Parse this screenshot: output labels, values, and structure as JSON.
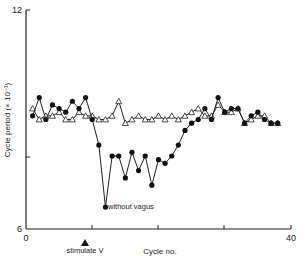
{
  "chart_data": {
    "type": "line",
    "title": "",
    "xlabel": "Cycle no.",
    "ylabel": "Cycle period (× 10⁻¹)",
    "xlim": [
      0,
      40
    ],
    "ylim": [
      6,
      12
    ],
    "x_ticks": [
      "0",
      "40"
    ],
    "y_ticks": [
      "6",
      "12"
    ],
    "grid": false,
    "annotations": [
      {
        "text": "stimulate V",
        "x": 12,
        "marker": "triangle-up",
        "position": "below x-axis"
      },
      {
        "text": "without vagus",
        "x": 21,
        "y": 7.1
      }
    ],
    "series": [
      {
        "name": "without vagus",
        "marker": "filled-circle",
        "x": [
          0,
          1,
          2,
          3,
          4,
          5,
          6,
          7,
          8,
          9,
          10,
          11,
          12,
          13,
          14,
          15,
          16,
          17,
          18,
          19,
          20,
          21,
          22,
          23,
          24,
          25,
          26,
          27,
          28,
          29,
          30,
          31,
          32,
          33,
          34,
          35,
          36,
          37
        ],
        "y": [
          9.1,
          9.6,
          9.0,
          9.4,
          9.3,
          9.2,
          9.5,
          9.3,
          9.6,
          9.0,
          8.3,
          6.6,
          8.0,
          8.0,
          7.4,
          8.1,
          7.6,
          8.0,
          7.2,
          7.9,
          7.8,
          8.0,
          8.3,
          8.7,
          8.9,
          9.0,
          9.3,
          9.0,
          9.6,
          9.2,
          9.3,
          9.3,
          8.9,
          9.1,
          9.2,
          9.0,
          8.9,
          8.9
        ]
      },
      {
        "name": "with vagus",
        "marker": "open-triangle",
        "x": [
          0,
          1,
          2,
          3,
          4,
          5,
          6,
          7,
          8,
          9,
          10,
          11,
          12,
          13,
          14,
          15,
          16,
          17,
          18,
          19,
          20,
          21,
          22,
          23,
          24,
          25,
          26,
          27,
          28,
          29,
          30,
          31,
          32,
          33,
          34,
          35,
          36,
          37
        ],
        "y": [
          9.3,
          9.0,
          9.1,
          9.1,
          9.2,
          9.0,
          9.0,
          9.2,
          9.1,
          9.1,
          9.0,
          9.0,
          9.1,
          9.5,
          8.9,
          9.0,
          9.1,
          9.0,
          9.0,
          9.1,
          9.0,
          9.1,
          9.0,
          9.1,
          9.2,
          9.3,
          9.1,
          9.1,
          9.4,
          9.2,
          9.2,
          9.3,
          8.9,
          9.0,
          9.1,
          9.1,
          8.9,
          8.9
        ]
      }
    ]
  },
  "labels": {
    "y_top": "12",
    "y_bottom": "6",
    "x_left": "0",
    "x_right": "40",
    "ylabel": "Cycle period (× 10⁻¹)",
    "xlabel": "Cycle no.",
    "stimulate": "stimulate V",
    "without_vagus": "without vagus"
  }
}
